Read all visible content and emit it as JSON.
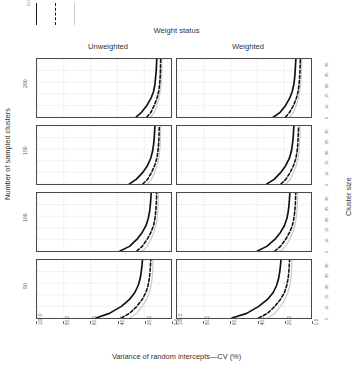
{
  "legend": {
    "title": "ICC",
    "keys": [
      {
        "name": "icc-low",
        "style": "solid"
      },
      {
        "name": "icc-mid",
        "style": "dashed"
      },
      {
        "name": "icc-high",
        "style": "light"
      }
    ]
  },
  "strips": {
    "top_title": "Weight status",
    "columns": [
      "Unweighted",
      "Weighted"
    ],
    "right_title": "Cluster size",
    "left_title": "Number of sampled clusters",
    "rows": [
      "200",
      "150",
      "100",
      "50"
    ]
  },
  "axes": {
    "xlabel": "Variance of random intercepts—CV (%)",
    "xticks": [
      "100.0",
      "80.0",
      "60.0",
      "40.0",
      "20.0",
      "0.0"
    ],
    "xlim": [
      100.0,
      0.0
    ],
    "cluster_size_ticks": [
      "5",
      "10",
      "15",
      "20",
      "25",
      "30"
    ]
  },
  "chart_data": {
    "type": "line",
    "title": "",
    "subtitle": "",
    "xlabel": "Variance of random intercepts—CV (%)",
    "ylabel": "Cluster size",
    "xlim": [
      100.0,
      0.0
    ],
    "ylim": [
      5,
      30
    ],
    "grid": true,
    "x_reversed": true,
    "legend_position": "top-left",
    "legend_title": "ICC",
    "facet_col_var": "Weight status",
    "facet_col_levels": [
      "Unweighted",
      "Weighted"
    ],
    "facet_row_var": "Number of sampled clusters",
    "facet_row_levels": [
      "200",
      "150",
      "100",
      "50"
    ],
    "panels": [
      {
        "row": "200",
        "col": "Unweighted",
        "series": [
          {
            "name": "icc-low",
            "style": "solid",
            "x": [
              26,
              22,
              18,
              15,
              13,
              12,
              11.5,
              11,
              10.8,
              10.6
            ],
            "y": [
              5,
              7,
              10,
              13,
              16,
              19,
              22,
              25,
              28,
              30
            ]
          },
          {
            "name": "icc-mid",
            "style": "dashed",
            "x": [
              18,
              15,
              12.5,
              10.5,
              9.2,
              8.5,
              8.1,
              7.9,
              7.8,
              7.7
            ],
            "y": [
              5,
              7,
              10,
              13,
              16,
              19,
              22,
              25,
              28,
              30
            ]
          },
          {
            "name": "icc-high",
            "style": "light",
            "x": [
              15,
              12.5,
              10.5,
              9,
              8,
              7.4,
              7.1,
              6.9,
              6.8,
              6.7
            ],
            "y": [
              5,
              7,
              10,
              13,
              16,
              19,
              22,
              25,
              28,
              30
            ]
          }
        ]
      },
      {
        "row": "200",
        "col": "Weighted",
        "series": [
          {
            "name": "icc-low",
            "style": "solid",
            "x": [
              28,
              23,
              19,
              16,
              14,
              12.8,
              12.2,
              11.8,
              11.5,
              11.3
            ],
            "y": [
              5,
              7,
              10,
              13,
              16,
              19,
              22,
              25,
              28,
              30
            ]
          },
          {
            "name": "icc-mid",
            "style": "dashed",
            "x": [
              19,
              16,
              13,
              11,
              9.6,
              8.9,
              8.5,
              8.2,
              8.05,
              7.95
            ],
            "y": [
              5,
              7,
              10,
              13,
              16,
              19,
              22,
              25,
              28,
              30
            ]
          },
          {
            "name": "icc-high",
            "style": "light",
            "x": [
              16,
              13,
              11,
              9.4,
              8.3,
              7.7,
              7.3,
              7.1,
              7.0,
              6.9
            ],
            "y": [
              5,
              7,
              10,
              13,
              16,
              19,
              22,
              25,
              28,
              30
            ]
          }
        ]
      },
      {
        "row": "150",
        "col": "Unweighted",
        "series": [
          {
            "name": "icc-low",
            "style": "solid",
            "x": [
              31,
              26,
              21,
              17.5,
              15.2,
              13.8,
              13,
              12.5,
              12.2,
              12
            ],
            "y": [
              5,
              7,
              10,
              13,
              16,
              19,
              22,
              25,
              28,
              30
            ]
          },
          {
            "name": "icc-mid",
            "style": "dashed",
            "x": [
              21,
              17.5,
              14.5,
              12.2,
              10.6,
              9.8,
              9.3,
              9,
              8.85,
              8.75
            ],
            "y": [
              5,
              7,
              10,
              13,
              16,
              19,
              22,
              25,
              28,
              30
            ]
          },
          {
            "name": "icc-high",
            "style": "light",
            "x": [
              17.5,
              14.5,
              12.2,
              10.4,
              9.2,
              8.5,
              8.1,
              7.9,
              7.8,
              7.7
            ],
            "y": [
              5,
              7,
              10,
              13,
              16,
              19,
              22,
              25,
              28,
              30
            ]
          }
        ]
      },
      {
        "row": "150",
        "col": "Weighted",
        "series": [
          {
            "name": "icc-low",
            "style": "solid",
            "x": [
              33,
              27.5,
              22.5,
              18.8,
              16.2,
              14.7,
              13.9,
              13.3,
              13,
              12.8
            ],
            "y": [
              5,
              7,
              10,
              13,
              16,
              19,
              22,
              25,
              28,
              30
            ]
          },
          {
            "name": "icc-mid",
            "style": "dashed",
            "x": [
              22.5,
              18.8,
              15.5,
              13,
              11.3,
              10.4,
              9.9,
              9.6,
              9.4,
              9.3
            ],
            "y": [
              5,
              7,
              10,
              13,
              16,
              19,
              22,
              25,
              28,
              30
            ]
          },
          {
            "name": "icc-high",
            "style": "light",
            "x": [
              18.8,
              15.5,
              13,
              11,
              9.7,
              9,
              8.6,
              8.3,
              8.2,
              8.1
            ],
            "y": [
              5,
              7,
              10,
              13,
              16,
              19,
              22,
              25,
              28,
              30
            ]
          }
        ]
      },
      {
        "row": "100",
        "col": "Unweighted",
        "series": [
          {
            "name": "icc-low",
            "style": "solid",
            "x": [
              38,
              31,
              25.5,
              21.5,
              18.6,
              17,
              16,
              15.4,
              15,
              14.8
            ],
            "y": [
              5,
              7,
              10,
              13,
              16,
              19,
              22,
              25,
              28,
              30
            ]
          },
          {
            "name": "icc-mid",
            "style": "dashed",
            "x": [
              25.5,
              21.5,
              17.8,
              15,
              13,
              12,
              11.4,
              11,
              10.8,
              10.7
            ],
            "y": [
              5,
              7,
              10,
              13,
              16,
              19,
              22,
              25,
              28,
              30
            ]
          },
          {
            "name": "icc-high",
            "style": "light",
            "x": [
              21.5,
              17.8,
              15,
              12.8,
              11.3,
              10.4,
              9.9,
              9.6,
              9.45,
              9.35
            ],
            "y": [
              5,
              7,
              10,
              13,
              16,
              19,
              22,
              25,
              28,
              30
            ]
          }
        ]
      },
      {
        "row": "100",
        "col": "Weighted",
        "series": [
          {
            "name": "icc-low",
            "style": "solid",
            "x": [
              40,
              33,
              27,
              22.8,
              19.8,
              18,
              17,
              16.4,
              16,
              15.8
            ],
            "y": [
              5,
              7,
              10,
              13,
              16,
              19,
              22,
              25,
              28,
              30
            ]
          },
          {
            "name": "icc-mid",
            "style": "dashed",
            "x": [
              27,
              22.8,
              18.9,
              16,
              13.9,
              12.8,
              12.1,
              11.7,
              11.5,
              11.4
            ],
            "y": [
              5,
              7,
              10,
              13,
              16,
              19,
              22,
              25,
              28,
              30
            ]
          },
          {
            "name": "icc-high",
            "style": "light",
            "x": [
              22.8,
              18.9,
              16,
              13.6,
              12,
              11.1,
              10.5,
              10.2,
              10.05,
              9.95
            ],
            "y": [
              5,
              7,
              10,
              13,
              16,
              19,
              22,
              25,
              28,
              30
            ]
          }
        ]
      },
      {
        "row": "50",
        "col": "Unweighted",
        "series": [
          {
            "name": "icc-low",
            "style": "solid",
            "x": [
              56,
              46,
              37,
              31,
              27,
              24.5,
              23,
              22.2,
              21.6,
              21.3
            ],
            "y": [
              5,
              7,
              10,
              13,
              16,
              19,
              22,
              25,
              28,
              30
            ]
          },
          {
            "name": "icc-mid",
            "style": "dashed",
            "x": [
              37,
              31,
              25.5,
              21.5,
              18.7,
              17.1,
              16.2,
              15.6,
              15.3,
              15.1
            ],
            "y": [
              5,
              7,
              10,
              13,
              16,
              19,
              22,
              25,
              28,
              30
            ]
          },
          {
            "name": "icc-high",
            "style": "light",
            "x": [
              31,
              25.5,
              21.5,
              18.3,
              16.2,
              14.9,
              14.1,
              13.7,
              13.45,
              13.3
            ],
            "y": [
              5,
              7,
              10,
              13,
              16,
              19,
              22,
              25,
              28,
              30
            ]
          }
        ]
      },
      {
        "row": "50",
        "col": "Weighted",
        "series": [
          {
            "name": "icc-low",
            "style": "solid",
            "x": [
              59,
              48,
              39,
              32.5,
              28.2,
              25.7,
              24.2,
              23.3,
              22.7,
              22.4
            ],
            "y": [
              5,
              7,
              10,
              13,
              16,
              19,
              22,
              25,
              28,
              30
            ]
          },
          {
            "name": "icc-mid",
            "style": "dashed",
            "x": [
              39,
              32.5,
              27,
              22.8,
              19.8,
              18.1,
              17.1,
              16.5,
              16.2,
              16
            ],
            "y": [
              5,
              7,
              10,
              13,
              16,
              19,
              22,
              25,
              28,
              30
            ]
          },
          {
            "name": "icc-high",
            "style": "light",
            "x": [
              32.5,
              27,
              22.8,
              19.4,
              17.2,
              15.8,
              15,
              14.5,
              14.3,
              14.15
            ],
            "y": [
              5,
              7,
              10,
              13,
              16,
              19,
              22,
              25,
              28,
              30
            ]
          }
        ]
      }
    ]
  }
}
